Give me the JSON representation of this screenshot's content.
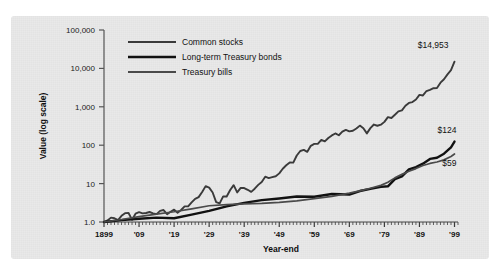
{
  "figure": {
    "background_color": "#e9e9e9",
    "page_color": "#ffffff"
  },
  "chart_data": {
    "type": "line",
    "title": "",
    "subtitle": "",
    "xlabel": "Year-end",
    "ylabel": "Value (log scale)",
    "scale": "log",
    "grid": false,
    "legend_position": "top-left-inside",
    "xlim": [
      1899,
      2000
    ],
    "ylim": [
      1.0,
      100000
    ],
    "ytick_labels": [
      "1.0",
      "10",
      "100",
      "1,000",
      "10,000",
      "100,000"
    ],
    "ytick_values": [
      1,
      10,
      100,
      1000,
      10000,
      100000
    ],
    "xtick_labels": [
      "1899",
      "'09",
      "'19",
      "'29",
      "'39",
      "'49",
      "'59",
      "'69",
      "'79",
      "'89",
      "'99"
    ],
    "xtick_values": [
      1899,
      1909,
      1919,
      1929,
      1939,
      1949,
      1959,
      1969,
      1979,
      1989,
      1999
    ],
    "minor_xtick_interval": 1,
    "annotations": [
      {
        "text": "$14,953",
        "series": "Common stocks",
        "x": 1999,
        "y": 14953
      },
      {
        "text": "$124",
        "series": "Long-term Treasury bonds",
        "x": 1999,
        "y": 124
      },
      {
        "text": "$59",
        "series": "Treasury bills",
        "x": 1999,
        "y": 59
      }
    ],
    "series": [
      {
        "name": "Common stocks",
        "color": "#3a3a3a",
        "width": 1.9,
        "x": [
          1899,
          1900,
          1901,
          1902,
          1903,
          1904,
          1905,
          1906,
          1907,
          1908,
          1909,
          1910,
          1911,
          1912,
          1913,
          1914,
          1915,
          1916,
          1917,
          1918,
          1919,
          1920,
          1921,
          1922,
          1923,
          1924,
          1925,
          1926,
          1927,
          1928,
          1929,
          1930,
          1931,
          1932,
          1933,
          1934,
          1935,
          1936,
          1937,
          1938,
          1939,
          1940,
          1941,
          1942,
          1943,
          1944,
          1945,
          1946,
          1947,
          1948,
          1949,
          1950,
          1951,
          1952,
          1953,
          1954,
          1955,
          1956,
          1957,
          1958,
          1959,
          1960,
          1961,
          1962,
          1963,
          1964,
          1965,
          1966,
          1967,
          1968,
          1969,
          1970,
          1971,
          1972,
          1973,
          1974,
          1975,
          1976,
          1977,
          1978,
          1979,
          1980,
          1981,
          1982,
          1983,
          1984,
          1985,
          1986,
          1987,
          1988,
          1989,
          1990,
          1991,
          1992,
          1993,
          1994,
          1995,
          1996,
          1997,
          1998,
          1999
        ],
        "y": [
          1.0,
          1.1,
          1.3,
          1.25,
          1.12,
          1.45,
          1.7,
          1.72,
          1.15,
          1.65,
          1.8,
          1.68,
          1.72,
          1.82,
          1.68,
          1.6,
          1.95,
          2.05,
          1.6,
          1.85,
          2.1,
          1.75,
          2.05,
          2.55,
          2.55,
          3.25,
          4.0,
          4.45,
          6.05,
          8.6,
          7.85,
          5.85,
          3.3,
          3.05,
          4.65,
          4.6,
          6.8,
          9.1,
          5.9,
          7.7,
          7.65,
          6.9,
          6.1,
          7.35,
          9.25,
          11.05,
          15.1,
          13.9,
          14.7,
          15.5,
          18.45,
          24.3,
          30.1,
          35.6,
          35.25,
          53.8,
          70.7,
          75.35,
          67.2,
          96.5,
          108.0,
          108.5,
          137.6,
          125.6,
          154.2,
          179.7,
          202.1,
          181.7,
          225.2,
          250.0,
          228.8,
          238.1,
          272.1,
          323.8,
          276.3,
          203.1,
          278.7,
          345.2,
          320.7,
          341.8,
          405.1,
          536.5,
          510.2,
          619.9,
          759.4,
          807.2,
          1063.4,
          1261.0,
          1327.4,
          1547.5,
          2037.0,
          1973.5,
          2574.6,
          2770.7,
          3049.1,
          3089.5,
          4249.4,
          5224.1,
          6967.8,
          8961.6,
          14953.0
        ]
      },
      {
        "name": "Long-term Treasury bonds",
        "color": "#111111",
        "width": 2.4,
        "x": [
          1899,
          1904,
          1909,
          1914,
          1919,
          1924,
          1929,
          1934,
          1939,
          1944,
          1949,
          1954,
          1959,
          1964,
          1969,
          1972,
          1975,
          1978,
          1980,
          1982,
          1984,
          1986,
          1988,
          1990,
          1992,
          1994,
          1996,
          1998,
          1999
        ],
        "y": [
          1.0,
          1.12,
          1.22,
          1.3,
          1.25,
          1.55,
          1.95,
          2.55,
          3.15,
          3.7,
          4.1,
          4.6,
          4.55,
          5.35,
          5.2,
          6.4,
          7.3,
          8.2,
          8.5,
          13.1,
          15.4,
          23.5,
          27.0,
          33.0,
          44.0,
          47.0,
          60.0,
          88.0,
          124.0
        ]
      },
      {
        "name": "Treasury bills",
        "color": "#4a4a4a",
        "width": 1.7,
        "x": [
          1899,
          1904,
          1909,
          1914,
          1919,
          1924,
          1929,
          1934,
          1939,
          1944,
          1949,
          1954,
          1959,
          1964,
          1969,
          1972,
          1975,
          1978,
          1980,
          1982,
          1984,
          1986,
          1988,
          1990,
          1992,
          1994,
          1996,
          1998,
          1999
        ],
        "y": [
          1.0,
          1.16,
          1.38,
          1.6,
          1.85,
          2.2,
          2.65,
          2.85,
          2.95,
          3.05,
          3.25,
          3.55,
          4.05,
          4.65,
          5.65,
          6.45,
          7.55,
          9.0,
          10.9,
          14.1,
          17.4,
          21.0,
          24.6,
          29.5,
          33.5,
          36.5,
          41.5,
          51.0,
          59.0
        ]
      }
    ]
  },
  "legend": {
    "items": [
      {
        "label": "Common stocks"
      },
      {
        "label": "Long-term Treasury bonds"
      },
      {
        "label": "Treasury bills"
      }
    ]
  }
}
